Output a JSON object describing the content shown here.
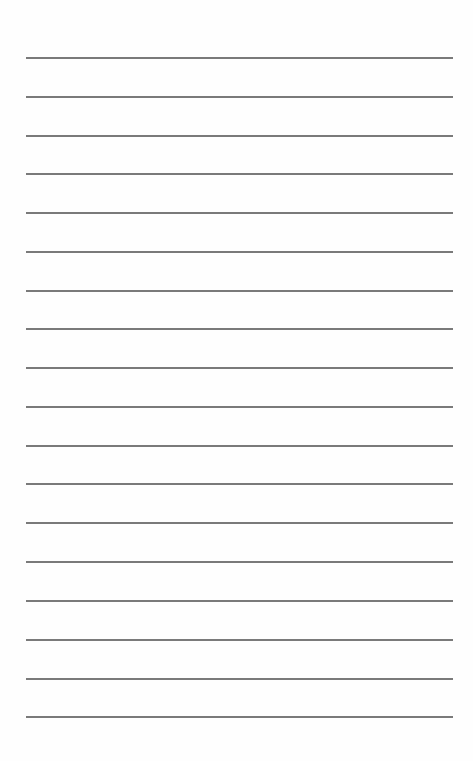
{
  "page": {
    "type": "lined-paper",
    "background_color": "#fefefe",
    "line_color": "#7a7a7a",
    "line_count": 18,
    "line_positions_y": [
      57,
      96,
      135,
      173,
      212,
      251,
      290,
      328,
      367,
      406,
      445,
      483,
      522,
      561,
      600,
      639,
      678,
      716
    ],
    "line_left_x": 26,
    "line_right_x": 453,
    "text_content": []
  }
}
